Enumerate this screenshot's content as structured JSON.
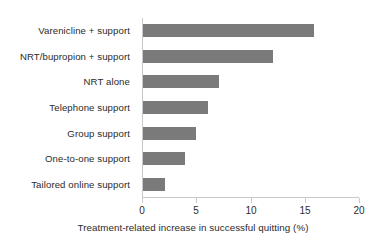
{
  "chart_data": {
    "type": "bar",
    "orientation": "horizontal",
    "title": "",
    "xlabel": "Treatment-related increase in successful quitting (%)",
    "ylabel": "",
    "xlim": [
      0,
      20
    ],
    "xticks": [
      0,
      5,
      10,
      15,
      20
    ],
    "xtick_labels": [
      "0",
      "5",
      "10",
      "15",
      "20"
    ],
    "grid": false,
    "legend": null,
    "bar_color": "#7a7a7a",
    "axis_color": "#c9c9c9",
    "text_color": "#2b2b2b",
    "background": "#ffffff",
    "categories": [
      "Varenicline + support",
      "NRT/bupropion + support",
      "NRT alone",
      "Telephone support",
      "Group support",
      "One-to-one support",
      "Tailored online support"
    ],
    "values": [
      15.8,
      12.0,
      7.0,
      6.0,
      4.9,
      3.9,
      2.0
    ]
  }
}
